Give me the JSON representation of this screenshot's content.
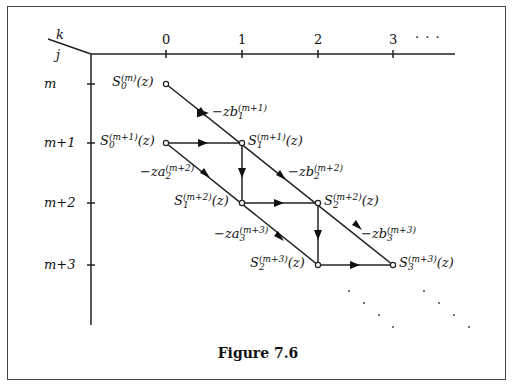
{
  "figure": {
    "caption": "Figure 7.6",
    "axis_corner": {
      "top": "k",
      "bottom": "j"
    },
    "column_labels": [
      "0",
      "1",
      "2",
      "3",
      "· · ·"
    ],
    "row_labels": [
      "m",
      "m+1",
      "m+2",
      "m+3"
    ],
    "nodes": [
      {
        "id": "S0_m",
        "base": "S",
        "sub": "0",
        "sup": "(m)",
        "tail": "(z)"
      },
      {
        "id": "S0_m1",
        "base": "S",
        "sub": "0",
        "sup": "(m+1)",
        "tail": "(z)"
      },
      {
        "id": "S1_m1",
        "base": "S",
        "sub": "1",
        "sup": "(m+1)",
        "tail": "(z)"
      },
      {
        "id": "S1_m2",
        "base": "S",
        "sub": "1",
        "sup": "(m+2)",
        "tail": "(z)"
      },
      {
        "id": "S2_m2",
        "base": "S",
        "sub": "2",
        "sup": "(m+2)",
        "tail": "(z)"
      },
      {
        "id": "S2_m3",
        "base": "S",
        "sub": "2",
        "sup": "(m+3)",
        "tail": "(z)"
      },
      {
        "id": "S3_m3",
        "base": "S",
        "sub": "3",
        "sup": "(m+3)",
        "tail": "(z)"
      }
    ],
    "edge_labels": [
      {
        "id": "b1",
        "base": "−zb",
        "sub": "1",
        "sup": "(m+1)"
      },
      {
        "id": "a2",
        "base": "−za",
        "sub": "2",
        "sup": "(m+2)"
      },
      {
        "id": "b2",
        "base": "−zb",
        "sub": "2",
        "sup": "(m+2)"
      },
      {
        "id": "a3",
        "base": "−za",
        "sub": "3",
        "sup": "(m+3)"
      },
      {
        "id": "b3",
        "base": "−zb",
        "sub": "3",
        "sup": "(m+3)"
      }
    ]
  }
}
